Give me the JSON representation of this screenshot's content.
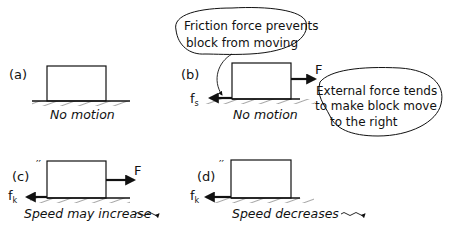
{
  "panels": [
    {
      "id": "a",
      "label": "(a)",
      "caption": "No motion",
      "forces": []
    },
    {
      "id": "b",
      "label": "(b)",
      "caption": "No motion",
      "forces": [
        {
          "name": "F",
          "direction": "right",
          "label": "F"
        },
        {
          "name": "fs",
          "direction": "left",
          "label": "f",
          "subscript": "s"
        }
      ],
      "callouts": [
        {
          "lines": [
            "Friction force prevents",
            "block from moving"
          ]
        },
        {
          "lines": [
            "External force tends",
            "to make block move",
            "to the right"
          ]
        }
      ]
    },
    {
      "id": "c",
      "label": "(c)",
      "caption": "Speed may increase",
      "forces": [
        {
          "name": "F",
          "direction": "right",
          "label": "F"
        },
        {
          "name": "fk",
          "direction": "left",
          "label": "f",
          "subscript": "k"
        }
      ]
    },
    {
      "id": "d",
      "label": "(d)",
      "caption": "Speed decreases",
      "forces": [
        {
          "name": "fk",
          "direction": "left",
          "label": "f",
          "subscript": "k"
        }
      ]
    }
  ],
  "colors": {
    "ink": "#111111",
    "background": "#ffffff"
  }
}
